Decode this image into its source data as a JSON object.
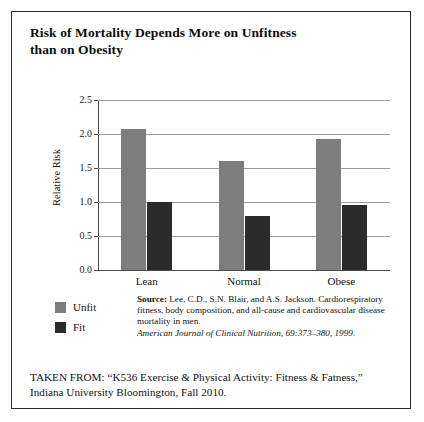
{
  "figure": {
    "title_line1": "Risk of Mortality Depends More on Unfitness",
    "title_line2": "than on Obesity"
  },
  "chart_data": {
    "type": "bar",
    "title": "Risk of Mortality Depends More on Unfitness than on Obesity",
    "xlabel": "",
    "ylabel": "Relative Risk",
    "categories": [
      "Lean",
      "Normal",
      "Obese"
    ],
    "series": [
      {
        "name": "Unfit",
        "color": "#7d7d7d",
        "values": [
          2.07,
          1.6,
          1.93
        ]
      },
      {
        "name": "Fit",
        "color": "#2b2b2b",
        "values": [
          1.0,
          0.8,
          0.95
        ]
      }
    ],
    "ylim": [
      0.0,
      2.5
    ],
    "ytick_labels": [
      "2.5",
      "2.0",
      "1.5",
      "1.0",
      "0.5",
      "0.0"
    ],
    "ytick_values": [
      2.5,
      2.0,
      1.5,
      1.0,
      0.5,
      0.0
    ],
    "grid": true,
    "legend_position": "below-left"
  },
  "legend": {
    "items": [
      {
        "label": "Unfit",
        "color": "#7d7d7d"
      },
      {
        "label": "Fit",
        "color": "#2b2b2b"
      }
    ]
  },
  "source": {
    "label": "Source:",
    "citation": " Lee, C.D., S.N. Blair, and A.S. Jackson. Cardiorespiratory fitness, body composition, and all-cause and cardiovascular disease mortality in men.",
    "journal": "American Journal of Clinical Nutrition, 69:373–380, 1999."
  },
  "taken_from": {
    "line1": "TAKEN FROM: “K536 Exercise & Physical Activity: Fitness & Fatness,”",
    "line2": "Indiana University Bloomington, Fall 2010."
  }
}
